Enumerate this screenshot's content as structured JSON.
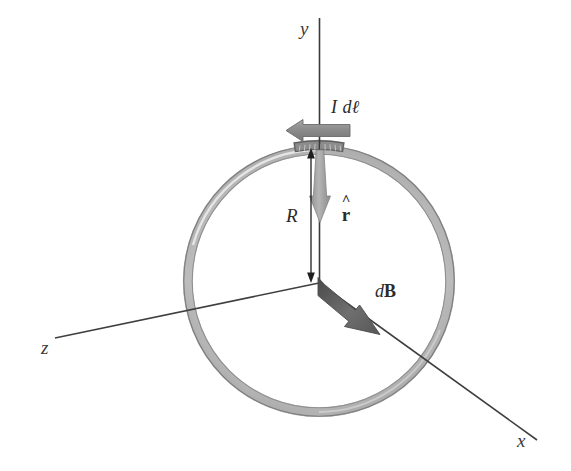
{
  "figure": {
    "width": 571,
    "height": 471,
    "background_color": "#ffffff"
  },
  "axes": [
    {
      "name": "y-axis",
      "label": "y",
      "direction": "up",
      "color": "#333333"
    },
    {
      "name": "z-axis",
      "label": "z",
      "direction": "lower-left",
      "color": "#444444"
    },
    {
      "name": "x-axis",
      "label": "x",
      "direction": "lower-right",
      "color": "#444444"
    }
  ],
  "ring": {
    "name": "current-loop",
    "center_x": 319,
    "center_y": 281,
    "radius": 131,
    "tube_width": 9,
    "fill_color": "#b9b9b9",
    "edge_color": "#8a8a8a",
    "highlight_color": "#9a9a9a"
  },
  "vectors": [
    {
      "name": "current-element",
      "label": "I dl",
      "label_parts": {
        "current": "I",
        "differential": "d",
        "length": "ℓ"
      },
      "color": "#8f8f8f",
      "direction": "left",
      "from_x": 350,
      "from_y": 130,
      "to_x": 287,
      "to_y": 130
    },
    {
      "name": "unit-vector-r-hat",
      "label": "r̂",
      "label_parts": {
        "hat": "^",
        "base": "r"
      },
      "color": "#9b9b9b",
      "direction": "down",
      "from_x": 320,
      "from_y": 150,
      "to_x": 320,
      "to_y": 222
    },
    {
      "name": "magnetic-field-element",
      "label": "dB",
      "label_parts": {
        "differential": "d",
        "field": "B"
      },
      "color": "#6e6e6e",
      "direction": "lower-right",
      "from_x": 319,
      "from_y": 283,
      "to_x": 378,
      "to_y": 332
    }
  ],
  "dimensions": [
    {
      "name": "radius-dimension",
      "label": "R",
      "color": "#1f1f1f",
      "from_x": 311,
      "from_y": 150,
      "to_x": 311,
      "to_y": 281,
      "arrowheads": "both"
    }
  ]
}
